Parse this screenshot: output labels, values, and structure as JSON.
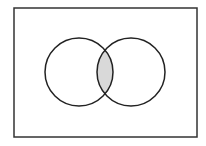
{
  "diagram": {
    "type": "venn",
    "universe": {
      "x": 14,
      "y": 8,
      "width": 183,
      "height": 129,
      "stroke": "#333333",
      "stroke_width": 1.5,
      "fill": "#ffffff"
    },
    "sets": [
      {
        "name": "A",
        "cx": 79,
        "cy": 72,
        "r": 34,
        "stroke": "#222222",
        "stroke_width": 1.5,
        "fill": "none"
      },
      {
        "name": "B",
        "cx": 131,
        "cy": 72,
        "r": 34,
        "stroke": "#222222",
        "stroke_width": 1.5,
        "fill": "none"
      }
    ],
    "shaded_region": "A ∩ B",
    "shade_color": "#d9d9d9"
  }
}
